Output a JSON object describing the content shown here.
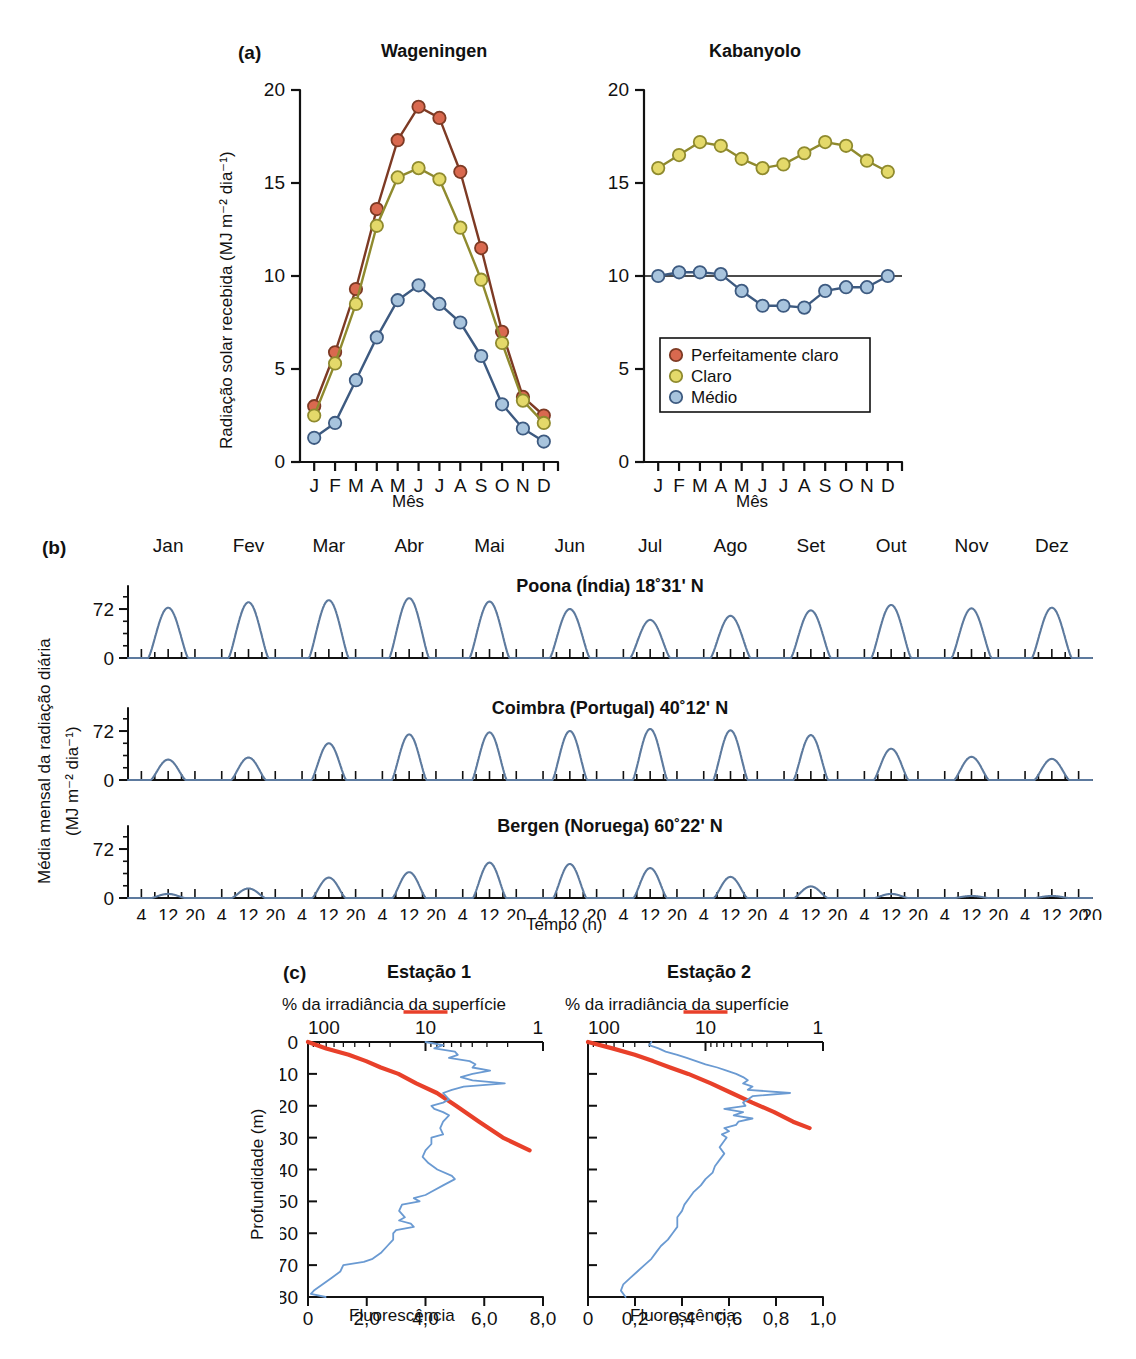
{
  "figure": {
    "panels": [
      "a",
      "b",
      "c"
    ]
  },
  "panel_a": {
    "tag": "(a)",
    "y_axis_label": "Radiação solar recebida (MJ m⁻² dia⁻¹)",
    "x_axis_label": "Mês",
    "y_ticks": [
      "0",
      "5",
      "10",
      "15",
      "20"
    ],
    "month_letters": [
      "J",
      "F",
      "M",
      "A",
      "M",
      "J",
      "J",
      "A",
      "S",
      "O",
      "N",
      "D"
    ],
    "legend": {
      "items": [
        {
          "label": "Perfeitamente claro",
          "color": "#d9694f"
        },
        {
          "label": "Claro",
          "color": "#e4d96a"
        },
        {
          "label": "Médio",
          "color": "#a8c4dd"
        }
      ]
    },
    "charts": [
      {
        "title": "Wageningen",
        "type": "line",
        "categories": [
          "J",
          "F",
          "M",
          "A",
          "M",
          "J",
          "J",
          "A",
          "S",
          "O",
          "N",
          "D"
        ],
        "ylim": [
          0,
          20
        ],
        "ylabel": "Radiação solar recebida (MJ m-2 dia-1)",
        "xlabel": "Mês",
        "series": [
          {
            "name": "Perfeitamente claro",
            "color": "#d9694f",
            "values": [
              3.0,
              5.9,
              9.3,
              13.6,
              17.3,
              19.1,
              18.5,
              15.6,
              11.5,
              7.0,
              3.5,
              2.5
            ]
          },
          {
            "name": "Claro",
            "color": "#e4d96a",
            "values": [
              2.5,
              5.3,
              8.5,
              12.7,
              15.3,
              15.8,
              15.2,
              12.6,
              9.8,
              6.4,
              3.3,
              2.1
            ]
          },
          {
            "name": "Médio",
            "color": "#a8c4dd",
            "values": [
              1.3,
              2.1,
              4.4,
              6.7,
              8.7,
              9.5,
              8.5,
              7.5,
              5.7,
              3.1,
              1.8,
              1.1
            ]
          }
        ]
      },
      {
        "title": "Kabanyolo",
        "type": "line",
        "categories": [
          "J",
          "F",
          "M",
          "A",
          "M",
          "J",
          "J",
          "A",
          "S",
          "O",
          "N",
          "D"
        ],
        "ylim": [
          0,
          20
        ],
        "xlabel": "Mês",
        "reference_line_y": 10,
        "series": [
          {
            "name": "Claro",
            "color": "#e4d96a",
            "values": [
              15.8,
              16.5,
              17.2,
              17.0,
              16.3,
              15.8,
              16.0,
              16.6,
              17.2,
              17.0,
              16.2,
              15.6
            ]
          },
          {
            "name": "Médio",
            "color": "#a8c4dd",
            "values": [
              10.0,
              10.2,
              10.2,
              10.1,
              9.2,
              8.4,
              8.4,
              8.3,
              9.2,
              9.4,
              9.4,
              10.0
            ]
          }
        ]
      }
    ]
  },
  "panel_b": {
    "tag": "(b)",
    "y_axis_label_line1": "Média mensal da radiação diária",
    "y_axis_label_line2": "(MJ m⁻² dia⁻¹)",
    "x_axis_label": "Tempo (h)",
    "months": [
      "Jan",
      "Fev",
      "Mar",
      "Abr",
      "Mai",
      "Jun",
      "Jul",
      "Ago",
      "Set",
      "Out",
      "Nov",
      "Dez"
    ],
    "y_ticks": [
      "0",
      "72"
    ],
    "hour_ticks": [
      "4",
      "12",
      "20"
    ],
    "final_hour_tick": "20",
    "line_color": "#5d7a9e",
    "charts": [
      {
        "title": "Poona (Índia) 18˚31' N",
        "type": "area",
        "ylim": [
          0,
          100
        ],
        "ylabel": "Média mensal da radiação diária (MJ m-2 dia-1)",
        "xlabel": "Tempo (h)",
        "categories": [
          "Jan",
          "Fev",
          "Mar",
          "Abr",
          "Mai",
          "Jun",
          "Jul",
          "Ago",
          "Set",
          "Out",
          "Nov",
          "Dez"
        ],
        "peak_values": [
          74,
          82,
          85,
          88,
          83,
          72,
          56,
          62,
          70,
          78,
          73,
          74
        ],
        "peak_half_width_h": 6.0
      },
      {
        "title": "Coimbra (Portugal) 40˚12' N",
        "type": "area",
        "ylim": [
          0,
          100
        ],
        "categories": [
          "Jan",
          "Fev",
          "Mar",
          "Abr",
          "Mai",
          "Jun",
          "Jul",
          "Ago",
          "Set",
          "Out",
          "Nov",
          "Dez"
        ],
        "peak_values": [
          30,
          33,
          54,
          67,
          70,
          72,
          75,
          73,
          66,
          46,
          34,
          31
        ],
        "peak_half_width_h": 5.2
      },
      {
        "title": "Bergen (Noruega) 60˚22' N",
        "type": "area",
        "ylim": [
          0,
          100
        ],
        "categories": [
          "Jan",
          "Fev",
          "Mar",
          "Abr",
          "Mai",
          "Jun",
          "Jul",
          "Ago",
          "Set",
          "Out",
          "Nov",
          "Dez"
        ],
        "peak_values": [
          6,
          14,
          30,
          38,
          52,
          50,
          44,
          31,
          17,
          6,
          3,
          3
        ],
        "peak_half_width_h": 5.0
      }
    ]
  },
  "panel_c": {
    "tag": "(c)",
    "y_axis_label": "Profundidade (m)",
    "top_axis_label": "% da irradiância da superfície",
    "bottom_axis_label": "Fluorescência",
    "irradiance_color": "#e8402a",
    "fluorescence_color": "#6a9ad2",
    "depth_ticks": [
      "0",
      "10",
      "20",
      "30",
      "40",
      "50",
      "60",
      "70",
      "80"
    ],
    "irradiance_ticks": [
      "100",
      "10",
      "1"
    ],
    "charts": [
      {
        "title": "Estação 1",
        "type": "line",
        "ylabel": "Profundidade (m)",
        "ylim": [
          0,
          80
        ],
        "top_xlabel": "% da irradiância da superfície",
        "top_xticks": [
          "100",
          "10",
          "1"
        ],
        "bottom_xlabel": "Fluorescência",
        "bottom_xticks": [
          "0",
          "2,0",
          "4,0",
          "6,0",
          "8,0"
        ],
        "bottom_xlim": [
          0,
          8
        ],
        "series": [
          {
            "name": "% da irradiância da superfície",
            "color": "#e8402a",
            "axis": "top-log",
            "points": [
              [
                100,
                0
              ],
              [
                70,
                2
              ],
              [
                45,
                4
              ],
              [
                32,
                6
              ],
              [
                24,
                8
              ],
              [
                17,
                10
              ],
              [
                12,
                13
              ],
              [
                8,
                16
              ],
              [
                5.5,
                20
              ],
              [
                3.5,
                25
              ],
              [
                2.2,
                30
              ],
              [
                1.3,
                34
              ]
            ]
          },
          {
            "name": "Fluorescência",
            "color": "#6a9ad2",
            "axis": "bottom-linear",
            "points": [
              [
                4.0,
                0
              ],
              [
                4.6,
                1
              ],
              [
                4.3,
                2
              ],
              [
                5.0,
                3
              ],
              [
                5.1,
                4
              ],
              [
                4.8,
                5
              ],
              [
                5.5,
                6
              ],
              [
                5.7,
                7
              ],
              [
                5.6,
                8
              ],
              [
                6.2,
                9
              ],
              [
                5.6,
                10
              ],
              [
                5.2,
                11
              ],
              [
                5.6,
                12
              ],
              [
                6.7,
                13
              ],
              [
                5.3,
                14
              ],
              [
                4.9,
                15
              ],
              [
                4.6,
                16
              ],
              [
                4.8,
                18
              ],
              [
                4.6,
                19
              ],
              [
                4.2,
                20
              ],
              [
                4.3,
                21
              ],
              [
                4.6,
                22
              ],
              [
                4.8,
                23
              ],
              [
                4.6,
                25
              ],
              [
                4.5,
                27
              ],
              [
                4.6,
                29
              ],
              [
                4.2,
                30
              ],
              [
                4.2,
                32
              ],
              [
                4.0,
                34
              ],
              [
                3.9,
                36
              ],
              [
                4.1,
                38
              ],
              [
                4.4,
                40
              ],
              [
                4.9,
                42
              ],
              [
                5.0,
                43
              ],
              [
                4.6,
                45
              ],
              [
                4.2,
                47
              ],
              [
                4.0,
                48
              ],
              [
                3.6,
                49
              ],
              [
                3.8,
                50
              ],
              [
                3.2,
                51
              ],
              [
                3.1,
                53
              ],
              [
                3.3,
                55
              ],
              [
                3.1,
                56
              ],
              [
                3.5,
                57
              ],
              [
                3.6,
                58
              ],
              [
                3.0,
                59
              ],
              [
                2.9,
                60
              ],
              [
                2.9,
                62
              ],
              [
                2.7,
                64
              ],
              [
                2.5,
                66
              ],
              [
                2.2,
                68
              ],
              [
                1.9,
                69
              ],
              [
                1.2,
                70
              ],
              [
                1.1,
                72
              ],
              [
                0.8,
                74
              ],
              [
                0.5,
                76
              ],
              [
                0.2,
                78
              ],
              [
                0.1,
                79
              ],
              [
                0.6,
                80
              ]
            ]
          }
        ]
      },
      {
        "title": "Estação 2",
        "type": "line",
        "ylim": [
          0,
          80
        ],
        "top_xlabel": "% da irradiância da superfície",
        "top_xticks": [
          "100",
          "10",
          "1"
        ],
        "bottom_xlabel": "Fluorescência",
        "bottom_xticks": [
          "0",
          "0,2",
          "0,4",
          "0,6",
          "0,8",
          "1,0"
        ],
        "bottom_xlim": [
          0,
          1
        ],
        "series": [
          {
            "name": "% da irradiância da superfície",
            "color": "#e8402a",
            "axis": "top-log",
            "points": [
              [
                100,
                0
              ],
              [
                62,
                2
              ],
              [
                40,
                4
              ],
              [
                28,
                6
              ],
              [
                20,
                8
              ],
              [
                14,
                10
              ],
              [
                9,
                13
              ],
              [
                6,
                16
              ],
              [
                4,
                19
              ],
              [
                2.6,
                22
              ],
              [
                1.8,
                25
              ],
              [
                1.3,
                27
              ]
            ]
          },
          {
            "name": "Fluorescência",
            "color": "#6a9ad2",
            "axis": "bottom-linear",
            "points": [
              [
                0.27,
                0
              ],
              [
                0.26,
                1
              ],
              [
                0.3,
                2
              ],
              [
                0.33,
                3
              ],
              [
                0.38,
                4
              ],
              [
                0.42,
                5
              ],
              [
                0.46,
                6
              ],
              [
                0.5,
                7
              ],
              [
                0.55,
                8
              ],
              [
                0.59,
                9
              ],
              [
                0.63,
                10
              ],
              [
                0.66,
                11
              ],
              [
                0.68,
                12
              ],
              [
                0.66,
                13
              ],
              [
                0.7,
                14
              ],
              [
                0.68,
                15
              ],
              [
                0.86,
                16
              ],
              [
                0.7,
                17
              ],
              [
                0.68,
                18
              ],
              [
                0.66,
                19
              ],
              [
                0.67,
                20
              ],
              [
                0.58,
                21
              ],
              [
                0.66,
                22
              ],
              [
                0.62,
                23
              ],
              [
                0.7,
                24
              ],
              [
                0.64,
                25
              ],
              [
                0.63,
                26
              ],
              [
                0.58,
                27
              ],
              [
                0.6,
                28
              ],
              [
                0.57,
                29
              ],
              [
                0.59,
                30
              ],
              [
                0.58,
                31
              ],
              [
                0.56,
                33
              ],
              [
                0.58,
                35
              ],
              [
                0.56,
                37
              ],
              [
                0.54,
                39
              ],
              [
                0.53,
                41
              ],
              [
                0.5,
                43
              ],
              [
                0.48,
                45
              ],
              [
                0.45,
                47
              ],
              [
                0.43,
                49
              ],
              [
                0.41,
                51
              ],
              [
                0.4,
                53
              ],
              [
                0.38,
                55
              ],
              [
                0.38,
                58
              ],
              [
                0.36,
                60
              ],
              [
                0.34,
                62
              ],
              [
                0.31,
                64
              ],
              [
                0.29,
                66
              ],
              [
                0.27,
                68
              ],
              [
                0.24,
                70
              ],
              [
                0.21,
                72
              ],
              [
                0.18,
                74
              ],
              [
                0.15,
                76
              ],
              [
                0.14,
                78
              ],
              [
                0.16,
                80
              ]
            ]
          }
        ]
      }
    ]
  }
}
